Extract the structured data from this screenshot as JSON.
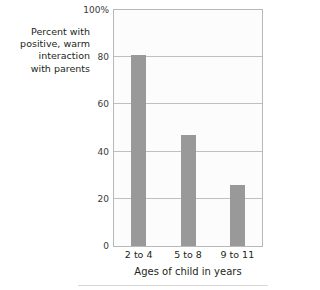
{
  "chart_data": {
    "type": "bar",
    "title": "",
    "subtitle": "",
    "categories": [
      "2 to 4",
      "5 to 8",
      "9 to 11"
    ],
    "values": [
      81,
      47,
      26
    ],
    "series": [
      {
        "name": "Percent with positive, warm interaction with parents",
        "values": [
          81,
          47,
          26
        ]
      }
    ],
    "xlabel": "Ages of child in years",
    "ylabel": "Percent with positive, warm interaction with parents",
    "ylim": [
      0,
      100
    ],
    "yticks": [
      "0",
      "20",
      "40",
      "60",
      "80",
      "100%"
    ],
    "ytick_values": [
      0,
      20,
      40,
      60,
      80,
      100
    ],
    "grid": true,
    "legend": "none",
    "bar_color": "#999999",
    "gridline_color": "#bfbfbf",
    "frame_color": "#b9b9b9",
    "plot_background": "#fcfcfc"
  },
  "y_axis_caption": {
    "line1": "Percent with",
    "line2": "positive, warm",
    "line3": "interaction",
    "line4": "with parents"
  },
  "x_axis": {
    "title": "Ages of child in years"
  }
}
